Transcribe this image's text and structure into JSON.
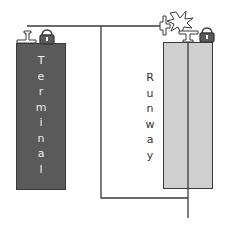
{
  "diagram": {
    "blocks": {
      "terminal": {
        "label": "Terminal",
        "letters": [
          "T",
          "e",
          "r",
          "m",
          "i",
          "n",
          "a",
          "l"
        ],
        "color": "#5a5a5a"
      },
      "runway": {
        "label": "Runway",
        "letters": [
          "R",
          "u",
          "n",
          "w",
          "a",
          "y"
        ],
        "color": "#cfcfcf"
      }
    },
    "icons": [
      "airplane-icon",
      "lock-icon",
      "collision-burst-icon",
      "airplane-icon",
      "lock-icon"
    ],
    "line_color": "#3a3a3a"
  }
}
